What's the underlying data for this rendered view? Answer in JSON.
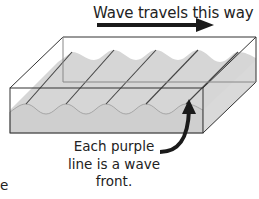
{
  "diagram": {
    "title": "Wave travels this way",
    "caption_lines": [
      "Each purple",
      "line is a wave",
      "front."
    ],
    "edge_fragment": "e",
    "colors": {
      "water": "#d6d6d6",
      "water_front": "#cfcfcf",
      "box_edge": "#333333",
      "wavefront_line": "#444444",
      "arrow": "#1a1a1a"
    }
  }
}
